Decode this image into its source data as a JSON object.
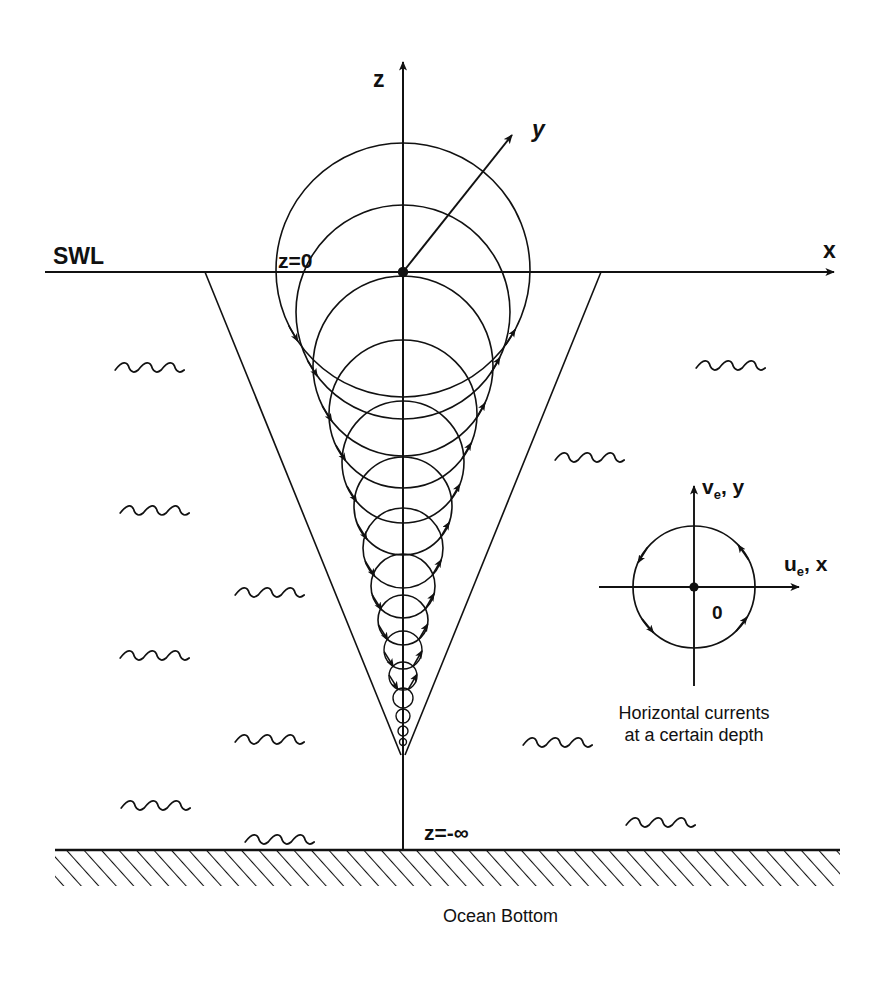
{
  "figure": {
    "title_semantic": "ekman-spiral-diagram",
    "background_color": "#ffffff",
    "ink_color": "#111111",
    "width": 885,
    "height": 984
  },
  "axes": {
    "z_label": "z",
    "y_label": "y",
    "x_label": "x",
    "surface_label": "SWL",
    "origin_label": "z=0",
    "bottom_depth_label": "z=-∞"
  },
  "seabed": {
    "label": "Ocean Bottom",
    "hatch_direction": "forward-slash",
    "surface_y": 850,
    "left_x": 55,
    "right_x": 840,
    "thickness": 36
  },
  "spiral": {
    "description": "Ekman spiral velocity circles decreasing with depth",
    "origin": {
      "x": 403,
      "y": 272
    },
    "apex": {
      "x": 403,
      "y": 755
    },
    "circles": [
      {
        "cy": 270,
        "r": 127
      },
      {
        "cy": 312,
        "r": 107
      },
      {
        "cy": 366,
        "r": 90
      },
      {
        "cy": 414,
        "r": 74
      },
      {
        "cy": 462,
        "r": 61
      },
      {
        "cy": 506,
        "r": 49
      },
      {
        "cy": 548,
        "r": 40
      },
      {
        "cy": 586,
        "r": 32
      },
      {
        "cy": 620,
        "r": 25
      },
      {
        "cy": 650,
        "r": 19
      },
      {
        "cy": 676,
        "r": 14
      },
      {
        "cy": 698,
        "r": 10
      },
      {
        "cy": 716,
        "r": 7
      },
      {
        "cy": 731,
        "r": 5
      },
      {
        "cy": 742,
        "r": 3.5
      }
    ]
  },
  "inset": {
    "name": "horizontal-currents-inset",
    "center": {
      "x": 694,
      "y": 587
    },
    "radius": 61,
    "origin_label": "0",
    "vertical_axis_label": "v",
    "vertical_axis_sub": "e",
    "vertical_axis_tail": ", y",
    "horizontal_axis_label": "u",
    "horizontal_axis_sub": "e",
    "horizontal_axis_tail": ", x",
    "caption_line1": "Horizontal currents",
    "caption_line2": "at a certain depth"
  },
  "wave_marks": [
    {
      "x": 152,
      "y": 370
    },
    {
      "x": 157,
      "y": 513
    },
    {
      "x": 272,
      "y": 595
    },
    {
      "x": 157,
      "y": 658
    },
    {
      "x": 272,
      "y": 742
    },
    {
      "x": 158,
      "y": 808
    },
    {
      "x": 733,
      "y": 368
    },
    {
      "x": 592,
      "y": 460
    },
    {
      "x": 560,
      "y": 745
    },
    {
      "x": 663,
      "y": 825
    },
    {
      "x": 282,
      "y": 842
    }
  ],
  "chart_data": {
    "type": "line",
    "xlabel": "x",
    "ylabel": "z",
    "annotations": [
      "SWL",
      "z=0",
      "z=-∞",
      "Ocean Bottom",
      "Horizontal currents at a certain depth"
    ],
    "series": [
      {
        "name": "velocity circle radius vs depth",
        "x": [
          270,
          312,
          366,
          414,
          462,
          506,
          548,
          586,
          620,
          650,
          676,
          698,
          716,
          731,
          742
        ],
        "values": [
          127,
          107,
          90,
          74,
          61,
          49,
          40,
          32,
          25,
          19,
          14,
          10,
          7,
          5,
          3.5
        ]
      }
    ],
    "grid": false,
    "legend": "none"
  }
}
